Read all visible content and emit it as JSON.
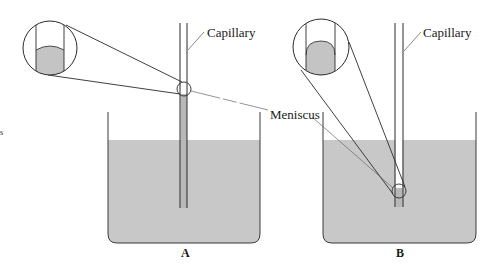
{
  "diagram": {
    "colors": {
      "liquid": "#c8c8c8",
      "line": "#2a2a2a",
      "leader": "#555555",
      "background": "#ffffff"
    },
    "panels": [
      {
        "id": "A",
        "label": "A",
        "capillary_label": "Capillary",
        "description": "Liquid rises in capillary; meniscus concave (wetting)",
        "meniscus_shape": "concave"
      },
      {
        "id": "B",
        "label": "B",
        "capillary_label": "Capillary",
        "description": "Liquid depressed in capillary; meniscus convex (non-wetting)",
        "meniscus_shape": "convex"
      }
    ],
    "shared_labels": {
      "meniscus": "Meniscus"
    },
    "edge_mark": "s"
  }
}
